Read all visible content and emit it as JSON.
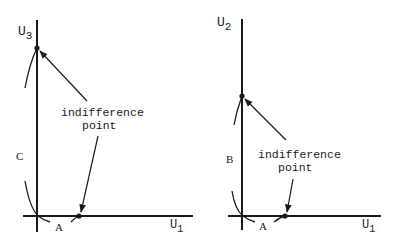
{
  "diagrams": [
    {
      "id": "left",
      "y_axis_label": "U",
      "y_axis_sub": "3",
      "x_axis_label": "U",
      "x_axis_sub": "1",
      "segment_vertical_label": "C",
      "segment_horizontal_label": "A",
      "annotation_line1": "indifference",
      "annotation_line2": "point"
    },
    {
      "id": "right",
      "y_axis_label": "U",
      "y_axis_sub": "2",
      "x_axis_label": "U",
      "x_axis_sub": "1",
      "segment_vertical_label": "B",
      "segment_horizontal_label": "A",
      "annotation_line1": "indifference",
      "annotation_line2": "point"
    }
  ],
  "colors": {
    "ink": "#1a1a1a",
    "background": "#ffffff"
  }
}
